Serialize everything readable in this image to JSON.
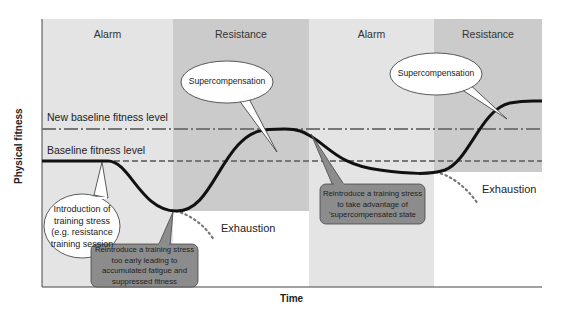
{
  "diagram": {
    "type": "general-adaptation-syndrome / supercompensation",
    "axes": {
      "x_title": "Time",
      "y_title": "Physical fitness"
    },
    "phases": [
      {
        "label": "Alarm",
        "shade": "#e3e3e3"
      },
      {
        "label": "Resistance",
        "shade": "#c9c9c9"
      },
      {
        "label": "Alarm",
        "shade": "#e3e3e3"
      },
      {
        "label": "Resistance",
        "shade": "#c9c9c9"
      }
    ],
    "levels": {
      "new_baseline": "New baseline fitness level",
      "baseline": "Baseline fitness level"
    },
    "bubbles": {
      "supercompensation_1": "Supercompensation",
      "supercompensation_2": "Supercompensation",
      "introduction": [
        "Introduction of",
        "training stress",
        "(e.g. resistance",
        "training session"
      ]
    },
    "callouts": {
      "too_early": [
        "Reintroduce a training stress",
        "too early leading to",
        "accumulated fatigue and",
        "suppressed fitness"
      ],
      "take_advantage": [
        "Reintroduce a training stress",
        "to take advantage of",
        "'supercompensated state"
      ]
    },
    "exhaustion_labels": [
      "Exhaustion",
      "Exhaustion"
    ],
    "colors": {
      "curve": "#111111",
      "dash_line": "#777777",
      "callout_fill": "#8c8c8c",
      "bubble_fill": "#ffffff"
    }
  }
}
